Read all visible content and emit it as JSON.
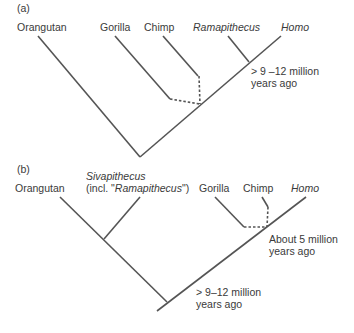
{
  "panel_a": {
    "label": "(a)",
    "taxa": {
      "orangutan": "Orangutan",
      "gorilla": "Gorilla",
      "chimp": "Chimp",
      "ramapithecus": "Ramapithecus",
      "homo": "Homo"
    },
    "date_line1": "> 9 –12 million",
    "date_line2": "years ago"
  },
  "panel_b": {
    "label": "(b)",
    "taxa": {
      "orangutan": "Orangutan",
      "sivapithecus": "Sivapithecus",
      "sivapithecus_note_pre": "(incl. \"",
      "sivapithecus_note_italic": "Ramapithecus",
      "sivapithecus_note_post": "\")",
      "gorilla": "Gorilla",
      "chimp": "Chimp",
      "homo": "Homo"
    },
    "date_recent_line1": "About 5 million",
    "date_recent_line2": "years ago",
    "date_old_line1": "> 9–12 million",
    "date_old_line2": "years ago"
  },
  "colors": {
    "line": "#555555",
    "text": "#3a3a3a"
  }
}
